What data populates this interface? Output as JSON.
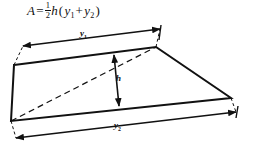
{
  "figure": {
    "kind": "geometry-diagram",
    "stroke_color": "#111111",
    "background_color": "#ffffff"
  },
  "formula": {
    "lhs": "A",
    "equals": "=",
    "fraction_numerator": "1",
    "fraction_denominator": "2",
    "factor": "h",
    "open_paren": "(",
    "term1": "y",
    "term1_sub": "1",
    "plus": "+",
    "term2": "y",
    "term2_sub": "2",
    "close_paren": ")"
  },
  "labels": {
    "y1": "y",
    "y1_sub": "1",
    "y2": "y",
    "y2_sub": "2",
    "h": "h"
  },
  "geometry": {
    "quadrilateral": [
      {
        "x": 14,
        "y": 65
      },
      {
        "x": 156,
        "y": 47
      },
      {
        "x": 231,
        "y": 98
      },
      {
        "x": 11,
        "y": 121
      }
    ],
    "dimension_y1": {
      "from": {
        "x": 23,
        "y": 46
      },
      "to": {
        "x": 160,
        "y": 29
      }
    },
    "dimension_y2": {
      "from": {
        "x": 16,
        "y": 138
      },
      "to": {
        "x": 236,
        "y": 112
      }
    },
    "dimension_h": {
      "from": {
        "x": 114,
        "y": 54
      },
      "to": {
        "x": 120,
        "y": 107
      }
    },
    "dashed_diagonal": {
      "from": {
        "x": 11,
        "y": 121
      },
      "to": {
        "x": 156,
        "y": 47
      }
    },
    "dashed_left_tick": {
      "from": {
        "x": 14,
        "y": 65
      },
      "to": {
        "x": 23,
        "y": 46
      }
    },
    "dashed_right_tick": {
      "from": {
        "x": 231,
        "y": 98
      },
      "to": {
        "x": 236,
        "y": 112
      }
    }
  }
}
